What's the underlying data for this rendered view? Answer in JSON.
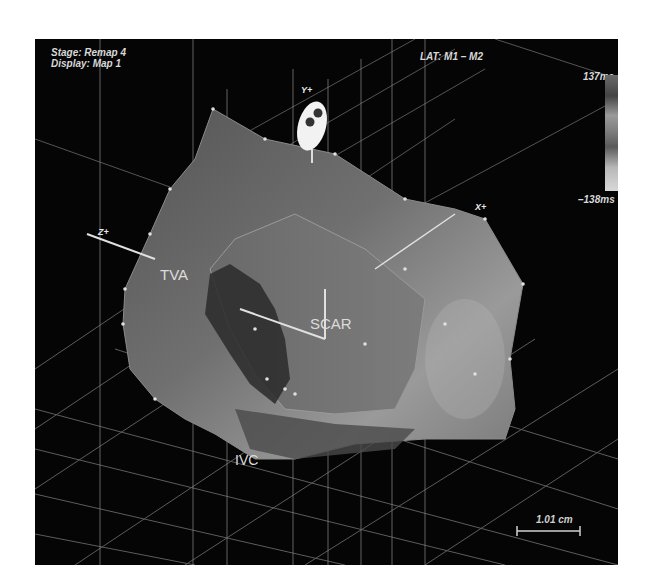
{
  "hud": {
    "stage": "Stage: Remap 4",
    "display": "Display: Map 1",
    "lat": "LAT: M1 – M2"
  },
  "colorbar": {
    "max_label": "137ms",
    "min_label": "–138ms"
  },
  "axes": {
    "x": "X+",
    "y": "Y+",
    "z": "Z+"
  },
  "anatomy_labels": {
    "tva": "TVA",
    "scar": "SCAR",
    "ivc": "IVC"
  },
  "scale_bar": {
    "label": "1.01 cm"
  },
  "colors": {
    "background": "#050505",
    "surface": "#6e6e6e",
    "grid": "#8a8a8a",
    "text": "#d8d8d8"
  }
}
